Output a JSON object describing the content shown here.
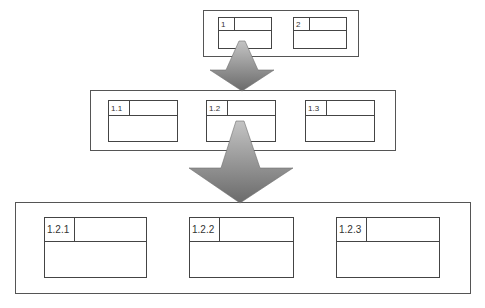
{
  "diagram": {
    "type": "hierarchy-decomposition",
    "levels": [
      {
        "name": "level-1",
        "items": [
          {
            "label": "1"
          },
          {
            "label": "2"
          }
        ]
      },
      {
        "name": "level-2",
        "items": [
          {
            "label": "1.1"
          },
          {
            "label": "1.2"
          },
          {
            "label": "1.3"
          }
        ]
      },
      {
        "name": "level-3",
        "items": [
          {
            "label": "1.2.1"
          },
          {
            "label": "1.2.2"
          },
          {
            "label": "1.2.3"
          }
        ]
      }
    ],
    "arrows": [
      {
        "from": "1",
        "to": "level-2"
      },
      {
        "from": "1.2",
        "to": "level-3"
      }
    ],
    "colors": {
      "border": "#444444",
      "arrow_light": "#bdbdbd",
      "arrow_dark": "#6e6e6e"
    }
  }
}
